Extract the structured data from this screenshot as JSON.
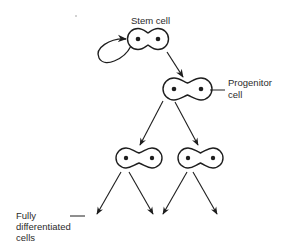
{
  "colors": {
    "stroke": "#1e1e1e",
    "text": "#2b2b2b",
    "background": "#ffffff"
  },
  "labels": {
    "stem_cell": "Stem cell",
    "progenitor_line1": "Progenitor",
    "progenitor_line2": "cell",
    "differentiated_line1": "Fully",
    "differentiated_line2": "differentiated",
    "differentiated_line3": "cells"
  },
  "nodes": [
    {
      "id": "stem-cell",
      "type": "dividing-cell",
      "label": "Stem cell",
      "self_renewal_loop": true
    },
    {
      "id": "progenitor-cell",
      "type": "dividing-cell",
      "label": "Progenitor cell"
    },
    {
      "id": "daughter-left",
      "type": "dividing-cell"
    },
    {
      "id": "daughter-right",
      "type": "dividing-cell"
    }
  ],
  "edges": [
    {
      "from": "stem-cell",
      "to": "stem-cell",
      "kind": "self-renewal"
    },
    {
      "from": "stem-cell",
      "to": "progenitor-cell"
    },
    {
      "from": "progenitor-cell",
      "to": "daughter-left"
    },
    {
      "from": "progenitor-cell",
      "to": "daughter-right"
    },
    {
      "from": "daughter-left",
      "to": "fully-differentiated-cell-1"
    },
    {
      "from": "daughter-left",
      "to": "fully-differentiated-cell-2"
    },
    {
      "from": "daughter-right",
      "to": "fully-differentiated-cell-3"
    },
    {
      "from": "daughter-right",
      "to": "fully-differentiated-cell-4"
    }
  ]
}
